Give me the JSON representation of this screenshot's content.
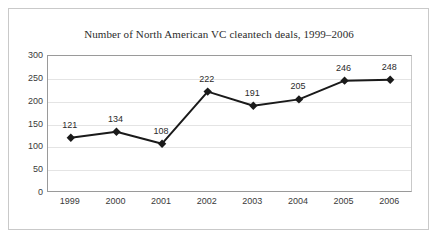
{
  "chart_data": {
    "type": "line",
    "title": "Number of North American VC cleantech deals, 1999–2006",
    "xlabel": "",
    "ylabel": "",
    "categories": [
      "1999",
      "2000",
      "2001",
      "2002",
      "2003",
      "2004",
      "2005",
      "2006"
    ],
    "values": [
      121,
      134,
      108,
      222,
      191,
      205,
      246,
      248
    ],
    "data_labels": [
      "121",
      "134",
      "108",
      "222",
      "191",
      "205",
      "246",
      "248"
    ],
    "ylim": [
      0,
      300
    ],
    "ytick_labels": [
      "0",
      "50",
      "100",
      "150",
      "200",
      "250",
      "300"
    ],
    "ytick_values": [
      0,
      50,
      100,
      150,
      200,
      250,
      300
    ],
    "grid": true,
    "legend": false,
    "marker": "diamond",
    "series": [
      {
        "name": "Number of deals",
        "values": [
          121,
          134,
          108,
          222,
          191,
          205,
          246,
          248
        ]
      }
    ],
    "colors": {
      "line": "#1a1a1a",
      "marker": "#1a1a1a",
      "gridline": "#e4e4e4",
      "axis": "#9a9a9a",
      "text": "#2b2b2b",
      "background": "#ffffff",
      "frame": "#c9c9c9"
    }
  }
}
